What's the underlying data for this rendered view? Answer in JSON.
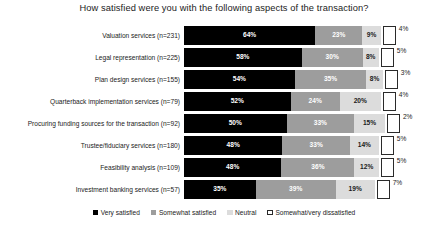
{
  "chart_data": {
    "type": "bar",
    "subtype": "stacked-horizontal-100pct",
    "title": "How satisfied were you with the following aspects of the transaction?",
    "xlabel": "",
    "ylabel": "",
    "xlim": [
      0,
      100
    ],
    "grid": false,
    "legend_position": "bottom",
    "categories": [
      "Valuation services (n=231)",
      "Legal representation (n=225)",
      "Plan design services (n=155)",
      "Quarterback implementation services (n=79)",
      "Procuring funding sources for the transaction (n=92)",
      "Trustee/fiduciary services (n=180)",
      "Feasibility analysis (n=109)",
      "Investment banking services (n=57)"
    ],
    "series": [
      {
        "name": "Very satisfied",
        "color": "#000000",
        "values": [
          64,
          58,
          54,
          52,
          50,
          48,
          48,
          35
        ],
        "labels": [
          "64%",
          "58%",
          "54%",
          "52%",
          "50%",
          "48%",
          "48%",
          "35%"
        ]
      },
      {
        "name": "Somewhat satisfied",
        "color": "#9d9d9d",
        "values": [
          23,
          30,
          35,
          24,
          33,
          33,
          36,
          39
        ],
        "labels": [
          "23%",
          "30%",
          "35%",
          "24%",
          "33%",
          "33%",
          "36%",
          "39%"
        ]
      },
      {
        "name": "Neutral",
        "color": "#dcdcdc",
        "values": [
          9,
          8,
          8,
          20,
          15,
          14,
          12,
          19
        ],
        "labels": [
          "9%",
          "8%",
          "8%",
          "20%",
          "15%",
          "14%",
          "12%",
          "19%"
        ]
      },
      {
        "name": "Somewhat/very dissatisfied",
        "color": "#ffffff",
        "values": [
          4,
          5,
          3,
          4,
          2,
          5,
          5,
          7
        ],
        "labels": [
          "4%",
          "5%",
          "3%",
          "4%",
          "2%",
          "5%",
          "5%",
          "7%"
        ]
      }
    ],
    "legend": [
      "Very satisfied",
      "Somewhat satisfied",
      "Neutral",
      "Somewhat/very dissatisfied"
    ]
  }
}
